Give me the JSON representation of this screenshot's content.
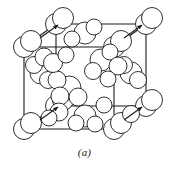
{
  "figure": {
    "caption": "(a)",
    "kind": "ball-model-unit-cell",
    "background_color": "#ffffff",
    "line_color": "#1a1a1a",
    "atom_fill": "#ffffff",
    "atom_stroke": "#1a1a1a",
    "line_width": 1.1,
    "atom_stroke_width": 0.9
  },
  "chart_data": {
    "type": "scatter",
    "xlabel": "",
    "ylabel": "",
    "xlim": [
      0,
      169
    ],
    "ylim": [
      0,
      172
    ],
    "grid": false,
    "legend": "none",
    "annotations": [
      "(a)"
    ],
    "cell_vertices": {
      "front_bottom_left": [
        24,
        129
      ],
      "front_bottom_right": [
        114,
        129
      ],
      "front_top_left": [
        24,
        47
      ],
      "front_top_right": [
        114,
        47
      ],
      "back_bottom_left": [
        56,
        106
      ],
      "back_bottom_right": [
        146,
        106
      ],
      "back_top_left": [
        56,
        24
      ],
      "back_top_right": [
        146,
        24
      ]
    },
    "cell_edges": [
      [
        "front_bottom_left",
        "front_bottom_right"
      ],
      [
        "front_bottom_right",
        "front_top_right"
      ],
      [
        "front_top_right",
        "front_top_left"
      ],
      [
        "front_top_left",
        "front_bottom_left"
      ],
      [
        "back_bottom_left",
        "back_bottom_right"
      ],
      [
        "back_bottom_right",
        "back_top_right"
      ],
      [
        "back_top_right",
        "back_top_left"
      ],
      [
        "back_top_left",
        "back_bottom_left"
      ],
      [
        "front_bottom_left",
        "back_bottom_left"
      ],
      [
        "front_bottom_right",
        "back_bottom_right"
      ],
      [
        "front_top_left",
        "back_top_left"
      ],
      [
        "front_top_right",
        "back_top_right"
      ]
    ],
    "arrows": [
      {
        "from": [
          40,
          38
        ],
        "to": [
          58,
          25
        ],
        "label": "corner-atom-pointer-top-left"
      },
      {
        "from": [
          124,
          38
        ],
        "to": [
          142,
          25
        ],
        "label": "corner-atom-pointer-top-right"
      },
      {
        "from": [
          40,
          120
        ],
        "to": [
          58,
          107
        ],
        "label": "corner-atom-pointer-bottom-left"
      },
      {
        "from": [
          124,
          120
        ],
        "to": [
          142,
          107
        ],
        "label": "corner-atom-pointer-bottom-right"
      }
    ],
    "atoms": [
      {
        "cx": 24,
        "cy": 47,
        "r": 10.5,
        "group": "corner-front-top-left"
      },
      {
        "cx": 31,
        "cy": 41,
        "r": 10.5,
        "group": "corner-front-top-left"
      },
      {
        "cx": 24,
        "cy": 129,
        "r": 10.5,
        "group": "corner-front-bottom-left"
      },
      {
        "cx": 31,
        "cy": 123,
        "r": 10.5,
        "group": "corner-front-bottom-left"
      },
      {
        "cx": 114,
        "cy": 129,
        "r": 10.5,
        "group": "corner-front-bottom-right"
      },
      {
        "cx": 121,
        "cy": 123,
        "r": 10.5,
        "group": "corner-front-bottom-right"
      },
      {
        "cx": 114,
        "cy": 47,
        "r": 10.5,
        "group": "corner-front-top-right"
      },
      {
        "cx": 121,
        "cy": 41,
        "r": 10.5,
        "group": "corner-front-top-right"
      },
      {
        "cx": 56,
        "cy": 24,
        "r": 10.5,
        "group": "corner-back-top-left"
      },
      {
        "cx": 63,
        "cy": 18,
        "r": 10.5,
        "group": "corner-back-top-left"
      },
      {
        "cx": 146,
        "cy": 24,
        "r": 10.5,
        "group": "corner-back-top-right"
      },
      {
        "cx": 152,
        "cy": 18,
        "r": 10.5,
        "group": "corner-back-top-right"
      },
      {
        "cx": 56,
        "cy": 106,
        "r": 10.5,
        "group": "corner-back-bottom-left"
      },
      {
        "cx": 63,
        "cy": 100,
        "r": 10.5,
        "group": "corner-back-bottom-left"
      },
      {
        "cx": 146,
        "cy": 106,
        "r": 10.5,
        "group": "corner-back-bottom-right"
      },
      {
        "cx": 152,
        "cy": 100,
        "r": 10.5,
        "group": "corner-back-bottom-right"
      },
      {
        "cx": 85,
        "cy": 33,
        "r": 11.0,
        "group": "face-top"
      },
      {
        "cx": 94,
        "cy": 27,
        "r": 8.0,
        "group": "face-top"
      },
      {
        "cx": 72,
        "cy": 39,
        "r": 8.0,
        "group": "face-top"
      },
      {
        "cx": 85,
        "cy": 116,
        "r": 11.0,
        "group": "face-bottom"
      },
      {
        "cx": 76,
        "cy": 123,
        "r": 8.0,
        "group": "face-bottom"
      },
      {
        "cx": 95,
        "cy": 124,
        "r": 8.0,
        "group": "face-bottom"
      },
      {
        "cx": 41,
        "cy": 73,
        "r": 11.0,
        "group": "face-left"
      },
      {
        "cx": 34,
        "cy": 65,
        "r": 8.5,
        "group": "face-left"
      },
      {
        "cx": 48,
        "cy": 80,
        "r": 8.5,
        "group": "face-left"
      },
      {
        "cx": 131,
        "cy": 73,
        "r": 11.0,
        "group": "face-right"
      },
      {
        "cx": 124,
        "cy": 65,
        "r": 8.5,
        "group": "face-right"
      },
      {
        "cx": 138,
        "cy": 80,
        "r": 8.5,
        "group": "face-right"
      },
      {
        "cx": 69,
        "cy": 88,
        "r": 12.0,
        "group": "interior-cluster-left"
      },
      {
        "cx": 57,
        "cy": 80,
        "r": 9.0,
        "group": "interior-cluster-left"
      },
      {
        "cx": 60,
        "cy": 96,
        "r": 9.0,
        "group": "interior-cluster-left"
      },
      {
        "cx": 78,
        "cy": 97,
        "r": 9.0,
        "group": "interior-cluster-left"
      },
      {
        "cx": 44,
        "cy": 57,
        "r": 9.0,
        "group": "interior-cluster-left"
      },
      {
        "cx": 53,
        "cy": 63,
        "r": 9.5,
        "group": "interior-cluster-left"
      },
      {
        "cx": 101,
        "cy": 60,
        "r": 11.0,
        "group": "interior-cluster-right"
      },
      {
        "cx": 110,
        "cy": 52,
        "r": 8.0,
        "group": "interior-cluster-right"
      },
      {
        "cx": 93,
        "cy": 71,
        "r": 8.5,
        "group": "interior-cluster-right"
      },
      {
        "cx": 118,
        "cy": 66,
        "r": 9.0,
        "group": "interior-cluster-right"
      },
      {
        "cx": 108,
        "cy": 79,
        "r": 8.0,
        "group": "interior-cluster-right"
      },
      {
        "cx": 66,
        "cy": 55,
        "r": 8.0,
        "group": "interior-upper"
      },
      {
        "cx": 104,
        "cy": 105,
        "r": 8.0,
        "group": "interior-lower"
      },
      {
        "cx": 59,
        "cy": 112,
        "r": 9.0,
        "group": "interior-lower"
      },
      {
        "cx": 49,
        "cy": 118,
        "r": 8.0,
        "group": "interior-lower"
      },
      {
        "cx": 131,
        "cy": 114,
        "r": 8.5,
        "group": "interior-lower"
      }
    ]
  }
}
